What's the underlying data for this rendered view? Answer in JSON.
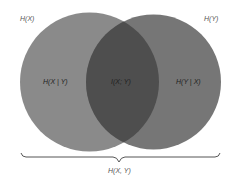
{
  "diagram": {
    "type": "venn",
    "sets": [
      {
        "id": "X",
        "label": "H(X)",
        "color": "#8a8a8a"
      },
      {
        "id": "Y",
        "label": "H(Y)",
        "color": "#767676"
      }
    ],
    "regions": {
      "x_only": {
        "label": "H(X | Y)"
      },
      "intersection": {
        "label": "I(X; Y)",
        "color": "#4e4e4e"
      },
      "y_only": {
        "label": "H(Y | X)"
      }
    },
    "brace": {
      "label": "H(X, Y)",
      "color": "#555555"
    }
  }
}
